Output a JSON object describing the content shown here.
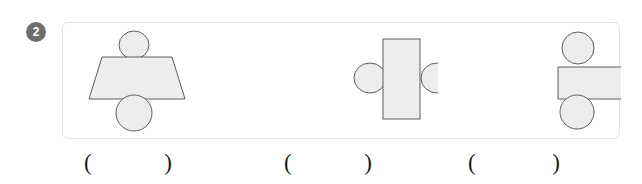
{
  "question": {
    "number": "2",
    "badge_bg": "#6e6e6e",
    "badge_fg": "#ffffff"
  },
  "panel": {
    "border_color": "#e3e3e3",
    "background": "#ffffff"
  },
  "shape_style": {
    "fill": "#ededed",
    "stroke": "#5e5e5e",
    "stroke_width": "1"
  },
  "groups": [
    {
      "id": "group-1",
      "name": "trapezoid-with-two-circles",
      "shapes": [
        {
          "name": "circle-top",
          "type": "ellipse",
          "cx": 71,
          "cy": 22,
          "rx": 15,
          "ry": 14
        },
        {
          "name": "isosceles-trapezoid",
          "type": "polygon",
          "points": "39,34 109,34 122,76 26,76"
        },
        {
          "name": "circle-bottom",
          "type": "ellipse",
          "cx": 71,
          "cy": 90,
          "rx": 18,
          "ry": 18
        }
      ]
    },
    {
      "id": "group-2",
      "name": "rectangle-with-two-circles",
      "shapes": [
        {
          "name": "circle-left",
          "type": "ellipse",
          "cx": 117,
          "cy": 55,
          "rx": 16,
          "ry": 15
        },
        {
          "name": "circle-right",
          "type": "ellipse",
          "cx": 184,
          "cy": 55,
          "rx": 16,
          "ry": 15
        },
        {
          "name": "vertical-rectangle",
          "type": "rect",
          "x": 130,
          "y": 16,
          "w": 37,
          "h": 80
        }
      ]
    },
    {
      "id": "group-3",
      "name": "right-trapezoid-with-two-circles",
      "shapes": [
        {
          "name": "circle-top",
          "type": "ellipse",
          "cx": 140,
          "cy": 25,
          "rx": 16,
          "ry": 16
        },
        {
          "name": "right-trapezoid",
          "type": "polygon",
          "points": "120,44 209,44 222,76 120,76"
        },
        {
          "name": "circle-bottom",
          "type": "ellipse",
          "cx": 139,
          "cy": 89,
          "rx": 17,
          "ry": 17
        }
      ]
    }
  ],
  "answers": [
    {
      "id": "answer-slot-1",
      "open": "(",
      "close": ")",
      "value": ""
    },
    {
      "id": "answer-slot-2",
      "open": "(",
      "close": ")",
      "value": ""
    },
    {
      "id": "answer-slot-3",
      "open": "(",
      "close": ")",
      "value": ""
    }
  ]
}
